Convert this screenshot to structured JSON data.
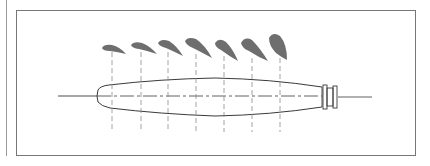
{
  "figure": {
    "colors": {
      "frame": "#777777",
      "outline": "#3a3a3a",
      "section_fill": "#6e6e6e",
      "station_line": "#8a8a8a",
      "margin_rule": "#9a9a9a"
    },
    "blade": {
      "tip_x": 97,
      "hub_x": 322,
      "centerline_y": 96,
      "centerline_start_x": 58,
      "centerline_end_x": 372
    },
    "stations": [
      {
        "index": 1,
        "x": 112,
        "section_scale": 0.55,
        "section_angle": 18
      },
      {
        "index": 2,
        "x": 141,
        "section_scale": 0.65,
        "section_angle": 24
      },
      {
        "index": 3,
        "x": 168,
        "section_scale": 0.75,
        "section_angle": 30
      },
      {
        "index": 4,
        "x": 196,
        "section_scale": 0.85,
        "section_angle": 36
      },
      {
        "index": 5,
        "x": 224,
        "section_scale": 0.9,
        "section_angle": 44
      },
      {
        "index": 6,
        "x": 252,
        "section_scale": 0.95,
        "section_angle": 52
      },
      {
        "index": 7,
        "x": 280,
        "section_scale": 1.0,
        "section_angle": 66
      }
    ]
  }
}
